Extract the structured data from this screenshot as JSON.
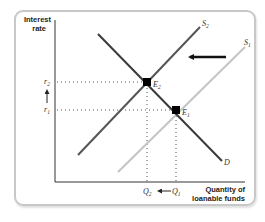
{
  "diagram": {
    "type": "supply-demand-shift",
    "y_axis": {
      "label_line1": "Interest",
      "label_line2": "rate"
    },
    "x_axis": {
      "label_line1": "Quantity of",
      "label_line2": "loanable funds"
    },
    "curves": [
      {
        "id": "D",
        "label": "D",
        "color": "#3a3a3a",
        "from": [
          98,
          34
        ],
        "to": [
          222,
          161
        ]
      },
      {
        "id": "S2",
        "label": "S",
        "subscript": "2",
        "color": "#555555",
        "from": [
          78,
          155
        ],
        "to": [
          200,
          27
        ]
      },
      {
        "id": "S1",
        "label": "S",
        "subscript": "1",
        "color": "#c4c4c4",
        "from": [
          118,
          172
        ],
        "to": [
          245,
          47
        ]
      }
    ],
    "equilibria": [
      {
        "id": "E2",
        "label": "E",
        "subscript": "2",
        "x": 147,
        "y": 82
      },
      {
        "id": "E1",
        "label": "E",
        "subscript": "1",
        "x": 176,
        "y": 110
      }
    ],
    "y_ticks": [
      {
        "label": "r",
        "subscript": "2",
        "y": 82
      },
      {
        "label": "r",
        "subscript": "1",
        "y": 110
      }
    ],
    "x_ticks": [
      {
        "label": "Q",
        "subscript": "2",
        "x": 147
      },
      {
        "label": "Q",
        "subscript": "1",
        "x": 176
      }
    ],
    "shift_arrow": {
      "direction": "left",
      "from": [
        226,
        57
      ],
      "to": [
        187,
        57
      ],
      "color": "#111111"
    },
    "annotations": {
      "rate_arrow_direction": "up",
      "quantity_arrow_direction": "left"
    }
  }
}
